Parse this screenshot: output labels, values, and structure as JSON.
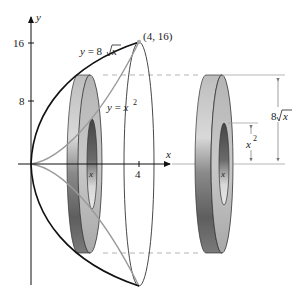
{
  "figure": {
    "type": "volume-of-revolution-washer-diagram",
    "axes": {
      "x_label": "x",
      "y_label": "y",
      "y_ticks": [
        "16",
        "8"
      ],
      "x_ticks": [
        "4"
      ]
    },
    "curves": {
      "outer": "y = 8√x",
      "inner": "y = x²"
    },
    "point_label": "(4, 16)",
    "washer_center_label": "x",
    "dimensions": {
      "outer_radius": "8√x",
      "inner_radius": "x²"
    },
    "labels": {
      "x_axis": "x",
      "y_axis": "y",
      "tick_16": "16",
      "tick_8": "8",
      "tick_4": "4",
      "curve_outer_prefix": "y = 8",
      "curve_outer_radicand": "x",
      "curve_inner_prefix": "y = x",
      "curve_inner_exp": "2",
      "point": "(4, 16)",
      "washer_left_x": "x",
      "washer_right_x": "x",
      "dim_outer_prefix": "8",
      "dim_outer_radicand": "x",
      "dim_inner_base": "x",
      "dim_inner_exp": "2"
    },
    "colors": {
      "outer_curve": "#111111",
      "inner_curve": "#9a9a9a",
      "dashed_line": "#b0b0b0",
      "washer_dark": "#5a5a5a",
      "washer_light": "#c8c8c8"
    }
  }
}
